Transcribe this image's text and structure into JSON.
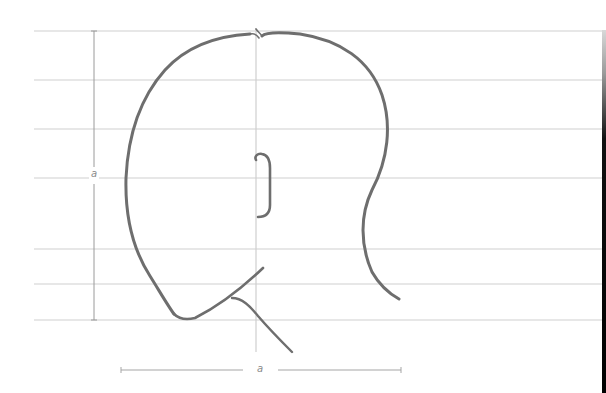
{
  "diagram": {
    "guidelines_y": [
      31,
      80,
      129,
      178,
      249,
      284,
      320
    ],
    "guideline_x_range": [
      34,
      604
    ],
    "center_line_x": 256,
    "center_line_y_range": [
      28,
      350
    ],
    "vertical_measure": {
      "x": 94,
      "y1": 31,
      "y2": 320,
      "label": "a",
      "label_pos": [
        94,
        175
      ]
    },
    "horizontal_measure": {
      "y": 370,
      "x1": 121,
      "x2": 401,
      "label": "a",
      "label_pos": [
        260,
        370
      ]
    },
    "colors": {
      "guideline": "#cfcfcf",
      "measure": "#9a9a9a",
      "stroke": "#6e6e6e",
      "background": "#ffffff"
    }
  }
}
